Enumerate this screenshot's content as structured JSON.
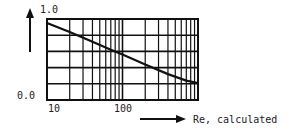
{
  "chart_data": {
    "type": "line",
    "title": "",
    "xlabel": "Re, calculated",
    "ylabel": "",
    "xscale": "log",
    "xlim": [
      10,
      1000
    ],
    "ylim": [
      0.0,
      1.0
    ],
    "x_tick_labels": [
      "10",
      "100"
    ],
    "y_tick_labels": [
      "0.0",
      "1.0"
    ],
    "grid": true,
    "y_grid_step": 0.2,
    "series": [
      {
        "name": "curve",
        "x": [
          10,
          20,
          40,
          70,
          100,
          200,
          400,
          700,
          1000
        ],
        "y": [
          0.95,
          0.84,
          0.72,
          0.62,
          0.56,
          0.44,
          0.32,
          0.24,
          0.21
        ]
      }
    ]
  }
}
